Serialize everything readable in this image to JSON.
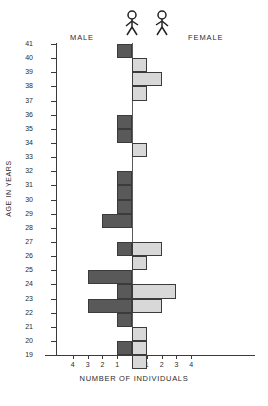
{
  "labels": {
    "male": "MALE",
    "female": "FEMALE",
    "y_title": "AGE IN YEARS",
    "x_title": "NUMBER OF INDIVIDUALS"
  },
  "icons": {
    "male_figure": "male-stick-figure-icon",
    "female_figure": "female-stick-figure-icon"
  },
  "colors": {
    "male_bar": "#595959",
    "female_bar": "#d8d8d8",
    "axis": "#3a3a3a",
    "bar_outline": "#3b3b3b"
  },
  "chart_data": {
    "type": "bar",
    "title": "",
    "subtype": "population-pyramid",
    "xlabel": "NUMBER OF INDIVIDUALS",
    "ylabel": "AGE IN YEARS",
    "categories": [
      41,
      40,
      39,
      38,
      37,
      36,
      35,
      34,
      33,
      32,
      31,
      30,
      29,
      28,
      27,
      26,
      25,
      24,
      23,
      22,
      21,
      20,
      19
    ],
    "y_tick_labels": [
      "41",
      "40",
      "39",
      "38",
      "37",
      "36",
      "35",
      "34",
      "33",
      "32",
      "31",
      "30",
      "29",
      "28",
      "27",
      "26",
      "25",
      "24",
      "23",
      "22",
      "21",
      "20",
      "19"
    ],
    "x_tick_labels_left": [
      "4",
      "3",
      "2",
      "1"
    ],
    "x_tick_labels_right": [
      "1",
      "2",
      "3",
      "4"
    ],
    "xlim": [
      -4.5,
      4.5
    ],
    "grid": false,
    "legend_position": "top",
    "series": [
      {
        "name": "MALE",
        "direction": "left",
        "color": "#595959",
        "values": [
          1,
          0,
          0,
          0,
          0,
          1,
          1,
          0,
          0,
          1,
          1,
          1,
          2,
          0,
          1,
          0,
          3,
          1,
          3,
          1,
          0,
          1,
          0
        ]
      },
      {
        "name": "FEMALE",
        "direction": "right",
        "color": "#d8d8d8",
        "values": [
          0,
          1,
          2,
          1,
          0,
          0,
          0,
          1,
          0,
          0,
          0,
          0,
          0,
          0,
          2,
          1,
          0,
          3,
          2,
          0,
          1,
          1,
          1
        ]
      }
    ],
    "bars": [
      {
        "age": 41,
        "male": 1,
        "female": 0
      },
      {
        "age": 40,
        "male": 0,
        "female": 1
      },
      {
        "age": 39,
        "male": 0,
        "female": 2
      },
      {
        "age": 38,
        "male": 0,
        "female": 1
      },
      {
        "age": 37,
        "male": 0,
        "female": 0
      },
      {
        "age": 36,
        "male": 1,
        "female": 0
      },
      {
        "age": 35,
        "male": 1,
        "female": 0
      },
      {
        "age": 34,
        "male": 0,
        "female": 1
      },
      {
        "age": 33,
        "male": 0,
        "female": 0
      },
      {
        "age": 32,
        "male": 1,
        "female": 0
      },
      {
        "age": 31,
        "male": 1,
        "female": 0
      },
      {
        "age": 30,
        "male": 1,
        "female": 0
      },
      {
        "age": 29,
        "male": 2,
        "female": 0
      },
      {
        "age": 28,
        "male": 0,
        "female": 0
      },
      {
        "age": 27,
        "male": 1,
        "female": 2
      },
      {
        "age": 26,
        "male": 0,
        "female": 1
      },
      {
        "age": 25,
        "male": 3,
        "female": 0
      },
      {
        "age": 24,
        "male": 1,
        "female": 3
      },
      {
        "age": 23,
        "male": 3,
        "female": 2
      },
      {
        "age": 22,
        "male": 1,
        "female": 0
      },
      {
        "age": 21,
        "male": 0,
        "female": 1
      },
      {
        "age": 20,
        "male": 1,
        "female": 1
      },
      {
        "age": 19,
        "male": 0,
        "female": 1
      }
    ]
  }
}
